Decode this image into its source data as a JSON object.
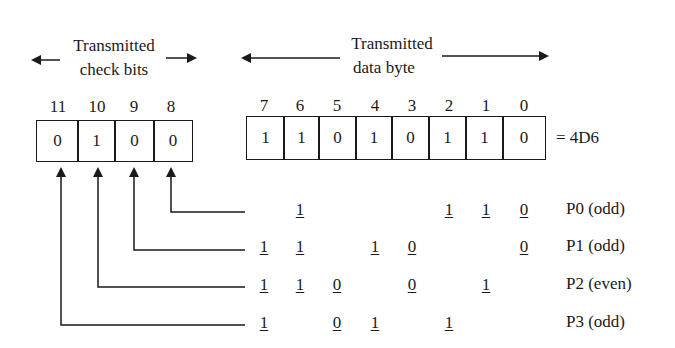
{
  "check_bits": {
    "label_line1": "Transmitted",
    "label_line2": "check bits",
    "positions": [
      "11",
      "10",
      "9",
      "8"
    ],
    "values": [
      "0",
      "1",
      "0",
      "0"
    ]
  },
  "data_byte": {
    "label_line1": "Transmitted",
    "label_line2": "data byte",
    "positions": [
      "7",
      "6",
      "5",
      "4",
      "3",
      "2",
      "1",
      "0"
    ],
    "values": [
      "1",
      "1",
      "0",
      "1",
      "0",
      "1",
      "1",
      "0"
    ],
    "hex_label": "= 4D6"
  },
  "parity_rows": [
    {
      "label": "P0 (odd)",
      "bits": [
        "",
        "1",
        "",
        "",
        "",
        "1",
        "1",
        "0"
      ]
    },
    {
      "label": "P1 (odd)",
      "bits": [
        "1",
        "1",
        "",
        "1",
        "0",
        "",
        "",
        "0"
      ]
    },
    {
      "label": "P2 (even)",
      "bits": [
        "1",
        "1",
        "0",
        "",
        "0",
        "",
        "1",
        ""
      ]
    },
    {
      "label": "P3 (odd)",
      "bits": [
        "1",
        "",
        "0",
        "1",
        "",
        "1",
        "",
        ""
      ]
    }
  ],
  "colors": {
    "ink": "#1a1a1a",
    "background": "#ffffff"
  }
}
